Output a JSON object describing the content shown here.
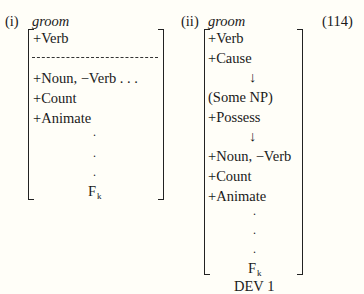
{
  "equation_number": "(114)",
  "panels": [
    {
      "label": "(i)",
      "word": "groom",
      "top_features": [
        "+Verb"
      ],
      "separator": "dashed",
      "bottom_features": [
        "+Noun, −Verb . . .",
        "+Count",
        "+Animate"
      ],
      "ellipsis_dots": [
        ".",
        ".",
        "."
      ],
      "final_feature": "F",
      "final_subscript": "k"
    },
    {
      "label": "(ii)",
      "word": "groom",
      "features": [
        "+Verb",
        "+Cause",
        "↓",
        "(Some NP)",
        "+Possess",
        "↓",
        "+Noun, −Verb",
        "+Count",
        "+Animate"
      ],
      "ellipsis_dots": [
        ".",
        ".",
        "."
      ],
      "final_feature": "F",
      "final_subscript": "k",
      "caption": "DEV 1"
    }
  ]
}
